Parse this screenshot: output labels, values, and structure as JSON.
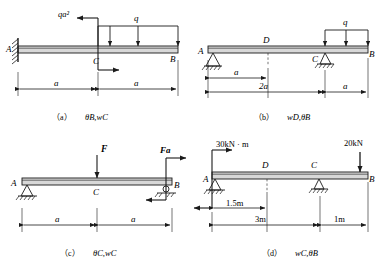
{
  "figure": {
    "type": "engineering-beam-diagrams",
    "panel_count": 4
  },
  "panels": [
    {
      "id": "a",
      "caption": "（a）θ_B, w_C",
      "caption_prefix": "（a）",
      "caption_symbols": "θB,wC",
      "beam": {
        "left_label": "A",
        "mid_label": "C",
        "right_label": "B"
      },
      "supports": [
        {
          "at": "A",
          "kind": "fixed"
        }
      ],
      "loads": [
        {
          "symbol": "qa²",
          "kind": "couple",
          "at": "C"
        },
        {
          "symbol": "q",
          "kind": "distributed",
          "from": "C",
          "to": "B",
          "arrows": 3
        }
      ],
      "dimensions": [
        {
          "label": "a",
          "span": "A-C"
        },
        {
          "label": "a",
          "span": "C-B"
        }
      ]
    },
    {
      "id": "b",
      "caption": "（b）w_D, θ_B",
      "caption_prefix": "（b）",
      "caption_symbols": "wD,θB",
      "beam": {
        "left_label": "A",
        "mid_label": "D",
        "mid2_label": "C",
        "right_label": "B"
      },
      "supports": [
        {
          "at": "A",
          "kind": "pin"
        },
        {
          "at": "C",
          "kind": "pin"
        }
      ],
      "loads": [
        {
          "symbol": "q",
          "kind": "distributed",
          "from": "C",
          "to": "B",
          "arrows": 3
        }
      ],
      "dimensions": [
        {
          "label": "a",
          "span": "A-D"
        },
        {
          "label": "2a",
          "span": "A-C"
        },
        {
          "label": "a",
          "span": "C-B"
        }
      ]
    },
    {
      "id": "c",
      "caption": "（c）θ_C, w_C",
      "caption_prefix": "（c）",
      "caption_symbols": "θC,wC",
      "beam": {
        "left_label": "A",
        "mid_label": "C",
        "right_label": "B"
      },
      "supports": [
        {
          "at": "A",
          "kind": "pin"
        },
        {
          "at": "B",
          "kind": "pin"
        }
      ],
      "loads": [
        {
          "symbol": "F",
          "kind": "point",
          "at": "C"
        },
        {
          "symbol": "Fa",
          "kind": "couple",
          "at": "B"
        }
      ],
      "dimensions": [
        {
          "label": "a",
          "span": "A-C"
        },
        {
          "label": "a",
          "span": "C-B"
        }
      ]
    },
    {
      "id": "d",
      "caption": "（d）w_C, θ_B",
      "caption_prefix": "（d）",
      "caption_symbols": "wC,θB",
      "beam": {
        "left_label": "A",
        "mid_label": "D",
        "mid2_label": "C",
        "right_label": "B"
      },
      "supports": [
        {
          "at": "A",
          "kind": "pin"
        },
        {
          "at": "C",
          "kind": "pin"
        }
      ],
      "loads": [
        {
          "symbol": "30kN · m",
          "kind": "couple",
          "at": "A"
        },
        {
          "symbol": "20kN",
          "kind": "point",
          "at": "B"
        }
      ],
      "dimensions": [
        {
          "label": "1.5m",
          "span": "A-D"
        },
        {
          "label": "3m",
          "span": "A-C"
        },
        {
          "label": "1m",
          "span": "C-B"
        }
      ]
    }
  ],
  "colors": {
    "line": "#1a1a1a",
    "beam_fill": "#d8d8d8",
    "background": "#ffffff"
  }
}
